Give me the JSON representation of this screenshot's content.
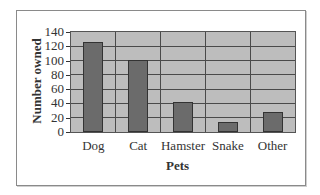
{
  "chart_data": {
    "type": "bar",
    "title": "",
    "xlabel": "Pets",
    "ylabel": "Number owned",
    "categories": [
      "Dog",
      "Cat",
      "Hamster",
      "Snake",
      "Other"
    ],
    "values": [
      125,
      100,
      40,
      12,
      26
    ],
    "ylim": [
      0,
      140
    ],
    "yticks": [
      0,
      20,
      40,
      60,
      80,
      100,
      120,
      140
    ],
    "grid": true,
    "legend": null,
    "colors": {
      "bar": "#6b6b6b",
      "plot_background": "#bdbdbd",
      "gridline": "#4a4a4a"
    }
  }
}
